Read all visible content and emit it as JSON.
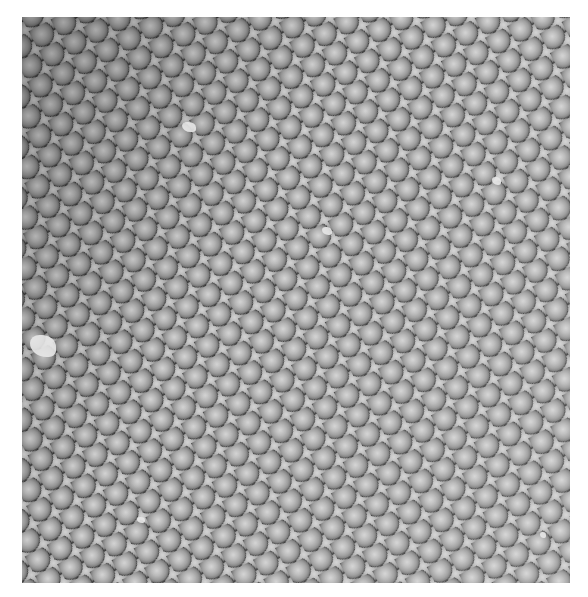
{
  "image": {
    "subject": "compound-eye-ommatidia-sem-micrograph",
    "colors": {
      "background": "#ffffff",
      "facet_highlight": "#d4d4d4",
      "facet_mid": "#9a9a9a",
      "facet_gap": "#3a3a3a",
      "debris": "#e8e8e8"
    }
  }
}
